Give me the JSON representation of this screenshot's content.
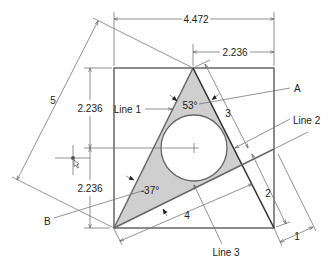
{
  "diagram": {
    "colors": {
      "shade": "#cfcfcf",
      "line": "#666666",
      "text": "#222222",
      "background": "#ffffff"
    },
    "dimensions": {
      "overall_width": "4.472",
      "half_width": "2.236",
      "upper_height": "2.236",
      "lower_height": "2.236",
      "slant_length": "5",
      "side_segment_3": "3",
      "segment_2": "2",
      "segment_4": "4",
      "offset_1": "1"
    },
    "angles": {
      "apex": "53°",
      "bottom_left": "-37°"
    },
    "callouts": {
      "a": "A",
      "b": "B",
      "line1": "Line 1",
      "line2": "Line 2",
      "line3": "Line 3"
    }
  }
}
